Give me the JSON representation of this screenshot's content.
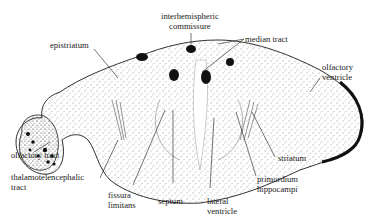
{
  "figure": {
    "colors": {
      "ink": "#1a1a1a",
      "background": "#ffffff"
    }
  },
  "labels": {
    "interhemispheric_commissure": [
      "interhemispheric",
      "commissure"
    ],
    "epistriatum": "epistriatum",
    "median_tract": "median tract",
    "olfactory_ventricle": [
      "olfactory",
      "ventricle"
    ],
    "olfactory_tract": "olfactory tract",
    "thalamotelencephalic_tract": [
      "thalamotelencephalic",
      "tract"
    ],
    "fissura_limitans": [
      "fissura",
      "limitans"
    ],
    "septum": "septum",
    "lateral_ventricle": [
      "lateral",
      "ventricle"
    ],
    "primordium_hippocampi": [
      "primordium",
      "hippocampi"
    ],
    "striatum": "striatum"
  }
}
